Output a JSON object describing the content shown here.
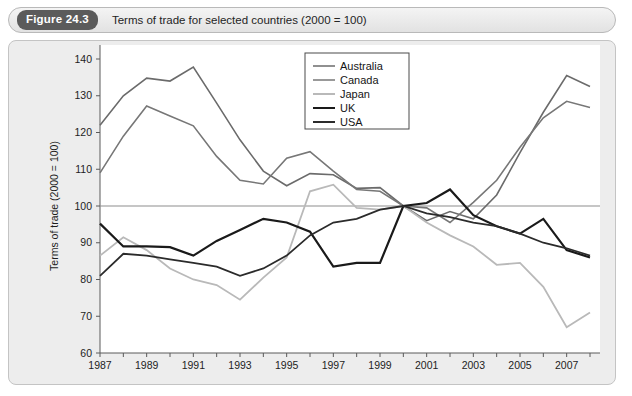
{
  "figure": {
    "badge": "Figure 24.3",
    "caption": "Terms of trade for selected countries (2000 = 100)"
  },
  "chart_data": {
    "type": "line",
    "title": "Terms of trade for selected countries (2000 = 100)",
    "xlabel": "",
    "ylabel": "Terms of trade (2000 = 100)",
    "xlim": [
      1987,
      2008
    ],
    "ylim": [
      60,
      140
    ],
    "ytick_step": 10,
    "yticks": [
      60,
      70,
      80,
      90,
      100,
      110,
      120,
      130,
      140
    ],
    "xticks": [
      1987,
      1989,
      1991,
      1993,
      1995,
      1997,
      1999,
      2001,
      2003,
      2005,
      2007
    ],
    "xtick_minor": [
      1988,
      1990,
      1992,
      1994,
      1996,
      1998,
      2000,
      2002,
      2004,
      2006,
      2008
    ],
    "grid": false,
    "reference_line": 100,
    "legend_position": "top-center-right",
    "x": [
      1987,
      1988,
      1989,
      1990,
      1991,
      1992,
      1993,
      1994,
      1995,
      1996,
      1997,
      1998,
      1999,
      2000,
      2001,
      2002,
      2003,
      2004,
      2005,
      2006,
      2007,
      2008
    ],
    "series": [
      {
        "name": "Australia",
        "color": "#6b6b6b",
        "width": 1.6,
        "values": [
          122.0,
          130.0,
          134.8,
          134.0,
          137.8,
          128.0,
          118.0,
          109.5,
          105.5,
          108.8,
          108.5,
          104.8,
          105.0,
          100.0,
          96.0,
          98.5,
          96.5,
          103.0,
          114.5,
          125.5,
          135.5,
          132.5
        ]
      },
      {
        "name": "Canada",
        "color": "#777777",
        "width": 1.6,
        "values": [
          109.0,
          119.0,
          127.2,
          124.5,
          121.8,
          113.5,
          107.0,
          106.0,
          113.0,
          114.8,
          109.5,
          104.5,
          104.0,
          100.0,
          99.5,
          95.5,
          101.0,
          107.0,
          116.0,
          124.0,
          128.5,
          126.8
        ]
      },
      {
        "name": "Japan",
        "color": "#b9b9b9",
        "width": 1.8,
        "values": [
          86.5,
          91.5,
          88.0,
          83.0,
          80.0,
          78.5,
          74.5,
          80.5,
          86.0,
          104.0,
          105.8,
          99.5,
          99.0,
          100.0,
          95.5,
          92.0,
          89.0,
          84.0,
          84.5,
          78.0,
          67.0,
          71.0
        ]
      },
      {
        "name": "UK",
        "color": "#1a1a1a",
        "width": 2.2,
        "values": [
          95.2,
          89.0,
          89.0,
          88.8,
          86.5,
          90.5,
          93.5,
          96.5,
          95.5,
          93.0,
          83.5,
          84.5,
          84.5,
          100.0,
          100.8,
          104.5,
          97.5,
          94.5,
          92.5,
          96.5,
          88.0,
          86.0
        ]
      },
      {
        "name": "USA",
        "color": "#2b2b2b",
        "width": 1.8,
        "values": [
          81.0,
          87.0,
          86.5,
          85.5,
          84.5,
          83.5,
          81.0,
          83.0,
          86.5,
          92.0,
          95.5,
          96.5,
          99.0,
          100.0,
          98.0,
          97.0,
          95.5,
          94.5,
          92.5,
          90.0,
          88.5,
          86.5
        ]
      }
    ],
    "legend": [
      {
        "label": "Australia",
        "color": "#6b6b6b",
        "width": 1.6
      },
      {
        "label": "Canada",
        "color": "#777777",
        "width": 1.6
      },
      {
        "label": "Japan",
        "color": "#b9b9b9",
        "width": 1.8
      },
      {
        "label": "UK",
        "color": "#1a1a1a",
        "width": 2.2
      },
      {
        "label": "USA",
        "color": "#2b2b2b",
        "width": 1.8
      }
    ]
  }
}
